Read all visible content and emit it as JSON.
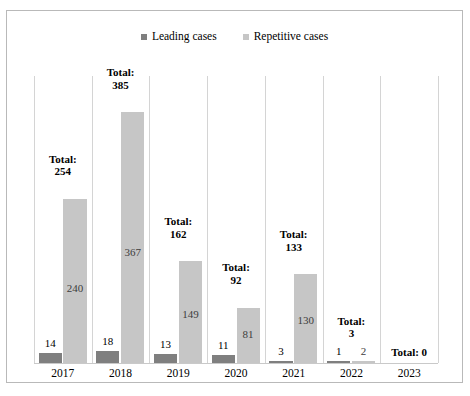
{
  "chart_data": {
    "type": "bar",
    "title": "",
    "subtitle": "",
    "xlabel": "",
    "ylabel": "",
    "grid": "vertical-category-separators",
    "legend_position": "top-center",
    "axis_visible": false,
    "ylim": [
      0,
      400
    ],
    "categories": [
      "2017",
      "2018",
      "2019",
      "2020",
      "2021",
      "2022",
      "2023"
    ],
    "series": [
      {
        "name": "Leading cases",
        "color": "#7f7f7f",
        "values": [
          14,
          18,
          13,
          11,
          3,
          1,
          0
        ]
      },
      {
        "name": "Repetitive cases",
        "color": "#c6c6c6",
        "values": [
          240,
          367,
          149,
          81,
          130,
          2,
          0
        ]
      }
    ],
    "totals": [
      254,
      385,
      162,
      92,
      133,
      3,
      0
    ],
    "total_labels": [
      "Total:\n254",
      "Total:\n385",
      "Total:\n162",
      "Total:\n92",
      "Total:\n133",
      "Total:\n3",
      "Total: 0"
    ],
    "annotations": [
      "Leading case value labels are drawn above each dark bar",
      "Repetitive case value labels are drawn inside each light bar",
      "Total labels are bold and drawn above each category group",
      "2023 has no bars; only the Total: 0 label is shown"
    ]
  },
  "legend": {
    "entries": [
      {
        "label": "Leading cases",
        "color": "#7f7f7f"
      },
      {
        "label": "Repetitive cases",
        "color": "#c6c6c6"
      }
    ]
  },
  "colors": {
    "leading": "#7f7f7f",
    "repetitive": "#c6c6c6",
    "frame_border": "#b9b9b9",
    "gridline": "#d4d4d4",
    "background": "#ffffff",
    "text": "#000000"
  }
}
